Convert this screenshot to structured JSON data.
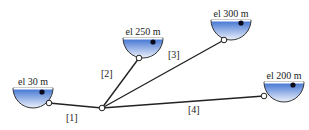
{
  "diagram": {
    "type": "reservoir-pipe-network",
    "colors": {
      "water_top": "#3a6fd0",
      "water_bottom": "#e8eefa",
      "pipe": "#222222",
      "text": "#222222"
    },
    "reservoirs": [
      {
        "id": "r1",
        "label": "el 30 m",
        "cx": 33,
        "top": 88,
        "outlet": [
          49,
          103
        ],
        "float": [
          42,
          91
        ]
      },
      {
        "id": "r2",
        "label": "el 250 m",
        "cx": 143,
        "top": 38,
        "outlet": [
          139,
          58
        ],
        "float": [
          153,
          41
        ]
      },
      {
        "id": "r3",
        "label": "el 300 m",
        "cx": 231,
        "top": 20,
        "outlet": [
          224,
          40
        ],
        "float": [
          241,
          22
        ]
      },
      {
        "id": "r4",
        "label": "el 200 m",
        "cx": 284,
        "top": 82,
        "outlet": [
          264,
          96
        ],
        "float": [
          293,
          84
        ]
      }
    ],
    "junction": [
      102,
      108
    ],
    "pipes": [
      {
        "id": "p1",
        "label": "[1]",
        "from": "r1",
        "label_pos": [
          66,
          121
        ]
      },
      {
        "id": "p2",
        "label": "[2]",
        "from": "r2",
        "label_pos": [
          101,
          77
        ]
      },
      {
        "id": "p3",
        "label": "[3]",
        "from": "r3",
        "label_pos": [
          168,
          58
        ]
      },
      {
        "id": "p4",
        "label": "[4]",
        "from": "r4",
        "label_pos": [
          188,
          113
        ]
      }
    ]
  }
}
